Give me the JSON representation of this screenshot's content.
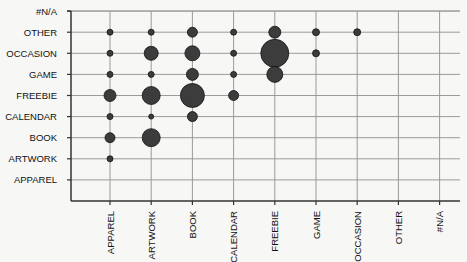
{
  "chart_data": {
    "type": "scatter",
    "subtype": "bubble",
    "title": "",
    "xlabel": "",
    "ylabel": "",
    "grid": true,
    "legend": "none",
    "x_categories": [
      "APPAREL",
      "ARTWORK",
      "BOOK",
      "CALENDAR",
      "FREEBIE",
      "GAME",
      "OCCASION",
      "OTHER",
      "#N/A"
    ],
    "y_categories": [
      "APPAREL",
      "ARTWORK",
      "BOOK",
      "CALENDAR",
      "FREEBIE",
      "GAME",
      "OCCASION",
      "OTHER",
      "#N/A"
    ],
    "colors": {
      "bubble": "#3c3c3c",
      "grid": "#9a9a9a",
      "axis": "#333333"
    },
    "points": [
      {
        "x": "APPAREL",
        "y": "OTHER",
        "size": 3
      },
      {
        "x": "APPAREL",
        "y": "OCCASION",
        "size": 3
      },
      {
        "x": "APPAREL",
        "y": "GAME",
        "size": 3
      },
      {
        "x": "APPAREL",
        "y": "FREEBIE",
        "size": 6
      },
      {
        "x": "APPAREL",
        "y": "CALENDAR",
        "size": 3
      },
      {
        "x": "APPAREL",
        "y": "BOOK",
        "size": 5
      },
      {
        "x": "APPAREL",
        "y": "ARTWORK",
        "size": 3
      },
      {
        "x": "ARTWORK",
        "y": "OTHER",
        "size": 3
      },
      {
        "x": "ARTWORK",
        "y": "OCCASION",
        "size": 7
      },
      {
        "x": "ARTWORK",
        "y": "GAME",
        "size": 3
      },
      {
        "x": "ARTWORK",
        "y": "FREEBIE",
        "size": 9
      },
      {
        "x": "ARTWORK",
        "y": "CALENDAR",
        "size": 2.5
      },
      {
        "x": "ARTWORK",
        "y": "BOOK",
        "size": 9
      },
      {
        "x": "BOOK",
        "y": "OTHER",
        "size": 5
      },
      {
        "x": "BOOK",
        "y": "OCCASION",
        "size": 7.5
      },
      {
        "x": "BOOK",
        "y": "GAME",
        "size": 6
      },
      {
        "x": "BOOK",
        "y": "FREEBIE",
        "size": 12
      },
      {
        "x": "BOOK",
        "y": "CALENDAR",
        "size": 5
      },
      {
        "x": "CALENDAR",
        "y": "OTHER",
        "size": 3
      },
      {
        "x": "CALENDAR",
        "y": "OCCASION",
        "size": 3
      },
      {
        "x": "CALENDAR",
        "y": "GAME",
        "size": 3
      },
      {
        "x": "CALENDAR",
        "y": "FREEBIE",
        "size": 5
      },
      {
        "x": "FREEBIE",
        "y": "OTHER",
        "size": 6
      },
      {
        "x": "FREEBIE",
        "y": "OCCASION",
        "size": 14
      },
      {
        "x": "FREEBIE",
        "y": "GAME",
        "size": 8
      },
      {
        "x": "GAME",
        "y": "OTHER",
        "size": 3.5
      },
      {
        "x": "GAME",
        "y": "OCCASION",
        "size": 3.5
      },
      {
        "x": "OCCASION",
        "y": "OTHER",
        "size": 3.5
      }
    ]
  }
}
